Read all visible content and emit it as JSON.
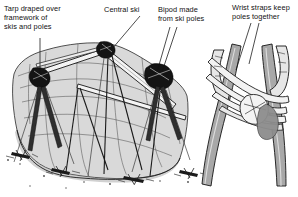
{
  "figure": {
    "type": "line-art-illustration",
    "background_color": "#ffffff",
    "ink_color": "#111111",
    "tarp_fill_color": "#d9d9d9",
    "pole_fill_color": "#bcbcbc",
    "strap_fill_color": "#efefef",
    "shadow_color": "#8d8d8d"
  },
  "labels": [
    {
      "id": "tarp",
      "text": "Tarp draped over\nframework of\nskis and poles",
      "x": 4,
      "y": 4
    },
    {
      "id": "central_ski",
      "text": "Central ski",
      "x": 104,
      "y": 5
    },
    {
      "id": "bipod",
      "text": "Bipod made\nfrom ski poles",
      "x": 158,
      "y": 5
    },
    {
      "id": "wrist_straps",
      "text": "Wrist straps keep\npoles together",
      "x": 232,
      "y": 3
    }
  ],
  "leaders": [
    {
      "id": "tarp-leader",
      "from": [
        40,
        38
      ],
      "to": [
        40,
        72
      ]
    },
    {
      "id": "central-ski-leader",
      "from": [
        140,
        16
      ],
      "to": [
        120,
        50
      ]
    },
    {
      "id": "bipod-leader-a",
      "from": [
        170,
        26
      ],
      "to": [
        160,
        72
      ]
    },
    {
      "id": "bipod-leader-b",
      "from": [
        176,
        26
      ],
      "to": [
        163,
        72
      ]
    },
    {
      "id": "wrist-leader-a",
      "from": [
        250,
        22
      ],
      "to": [
        238,
        66
      ]
    },
    {
      "id": "wrist-leader-b",
      "from": [
        258,
        22
      ],
      "to": [
        247,
        62
      ]
    }
  ]
}
